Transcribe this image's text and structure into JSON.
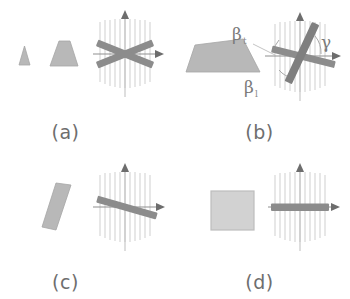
{
  "figure": {
    "background_color": "#ffffff",
    "shape_fill": "#b8b8b8",
    "shape_stroke": "#9a9a9a",
    "bar_color": "#8a8a8a",
    "hatch_color": "#c9c9c9",
    "axis_color": "#7d7d7d",
    "label_color": "#6e6e6e",
    "panels": [
      {
        "id": "a",
        "caption": "(a)",
        "shapes": [
          "triangle",
          "trapezoid"
        ],
        "bars": [
          "bar-up-right",
          "bar-down-right"
        ],
        "axes": [
          "vertical-arrow",
          "horizontal-arrow"
        ],
        "hatch_lines": 11,
        "angle_labels": []
      },
      {
        "id": "b",
        "caption": "(b)",
        "shapes": [
          "wedge"
        ],
        "bars": [
          "bar-shallow",
          "bar-steep"
        ],
        "axes": [
          "vertical-arrow",
          "horizontal-arrow"
        ],
        "hatch_lines": 11,
        "angle_labels": [
          {
            "name": "beta-t",
            "base": "β",
            "sub": "t"
          },
          {
            "name": "beta-l",
            "base": "β",
            "sub": "l"
          },
          {
            "name": "gamma",
            "base": "γ",
            "sub": ""
          }
        ]
      },
      {
        "id": "c",
        "caption": "(c)",
        "shapes": [
          "parallelogram"
        ],
        "bars": [
          "bar-tilted"
        ],
        "axes": [
          "vertical-arrow",
          "horizontal-arrow"
        ],
        "hatch_lines": 11,
        "angle_labels": []
      },
      {
        "id": "d",
        "caption": "(d)",
        "shapes": [
          "square"
        ],
        "bars": [
          "bar-horizontal"
        ],
        "axes": [
          "vertical-arrow",
          "horizontal-arrow"
        ],
        "hatch_lines": 11,
        "angle_labels": []
      }
    ]
  }
}
